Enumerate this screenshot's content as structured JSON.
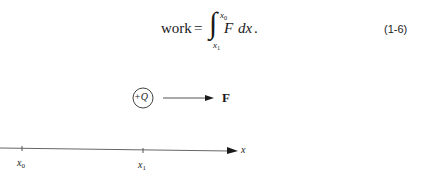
{
  "equation": {
    "lhs": "work",
    "equals": "=",
    "integral_sign": "∫",
    "upper_limit": "x",
    "upper_limit_sub": "0",
    "lower_limit": "x",
    "lower_limit_sub": "1",
    "integrand": "F",
    "differential": "dx",
    "terminator": ".",
    "number": "(1-6)"
  },
  "diagram": {
    "charge": {
      "label": "+Q"
    },
    "force": {
      "label": "F"
    },
    "axis": {
      "label": "x",
      "ticks": [
        {
          "label": "x",
          "sub": "0"
        },
        {
          "label": "x",
          "sub": "1"
        }
      ]
    }
  },
  "colors": {
    "ink": "#1a1a1a",
    "line": "#555555",
    "background": "#ffffff"
  }
}
